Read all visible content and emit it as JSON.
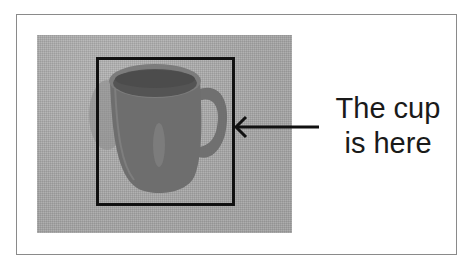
{
  "figure": {
    "annotation": {
      "line1": "The cup",
      "line2": "is here"
    },
    "photo_subject": "mug",
    "colors": {
      "frame_border": "#8a8a8a",
      "background": "#ffffff",
      "photo_background": "#a9a9a9",
      "mug_body": "#6e6e6e",
      "mug_interior": "#545454",
      "box_stroke": "#111111",
      "arrow": "#111111",
      "text": "#1a1a1a"
    }
  }
}
